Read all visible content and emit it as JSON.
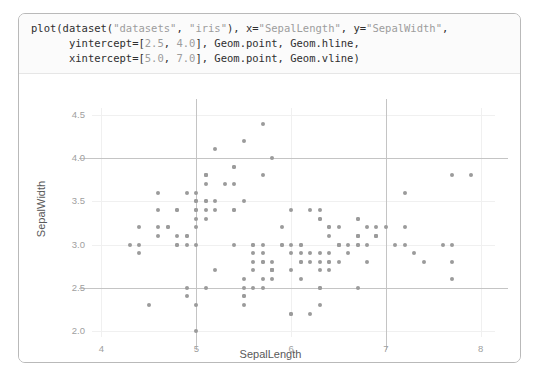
{
  "code": {
    "lines": [
      [
        {
          "t": "plot(dataset(",
          "k": "plain"
        },
        {
          "t": "\"datasets\"",
          "k": "lit"
        },
        {
          "t": ", ",
          "k": "plain"
        },
        {
          "t": "\"iris\"",
          "k": "lit"
        },
        {
          "t": "), x=",
          "k": "plain"
        },
        {
          "t": "\"SepalLength\"",
          "k": "lit"
        },
        {
          "t": ", y=",
          "k": "plain"
        },
        {
          "t": "\"SepalWidth\"",
          "k": "lit"
        },
        {
          "t": ",",
          "k": "plain"
        }
      ],
      [
        {
          "t": "      yintercept=[",
          "k": "plain"
        },
        {
          "t": "2.5",
          "k": "lit"
        },
        {
          "t": ", ",
          "k": "plain"
        },
        {
          "t": "4.0",
          "k": "lit"
        },
        {
          "t": "], Geom.point, Geom.hline,",
          "k": "plain"
        }
      ],
      [
        {
          "t": "      xintercept=[",
          "k": "plain"
        },
        {
          "t": "5.0",
          "k": "lit"
        },
        {
          "t": ", ",
          "k": "plain"
        },
        {
          "t": "7.0",
          "k": "lit"
        },
        {
          "t": "], Geom.point, Geom.vline)",
          "k": "plain"
        }
      ]
    ],
    "plain_color": "#2f2f2f",
    "literal_color": "#9d9d9d",
    "background": "#fbfbfb"
  },
  "chart_data": {
    "type": "scatter",
    "title": "",
    "xlabel": "SepalLength",
    "ylabel": "SepalWidth",
    "xlim": [
      3.9,
      8.15
    ],
    "ylim": [
      1.93,
      4.58
    ],
    "xticks": [
      4,
      5,
      6,
      7,
      8
    ],
    "yticks": [
      2.0,
      2.5,
      3.0,
      3.5,
      4.0,
      4.5
    ],
    "xtick_labels": [
      "4",
      "5",
      "6",
      "7",
      "8"
    ],
    "ytick_labels": [
      "2.0",
      "2.5",
      "3.0",
      "3.5",
      "4.0",
      "4.5"
    ],
    "grid": true,
    "legend": "none",
    "point_color": "#9b9b9b",
    "point_size": 4,
    "intercept_color": "#c4c4c4",
    "yintercept": [
      2.5,
      4.0
    ],
    "xintercept": [
      5.0,
      7.0
    ],
    "series": [
      {
        "name": "iris",
        "x": [
          5.1,
          4.9,
          4.7,
          4.6,
          5.0,
          5.4,
          4.6,
          5.0,
          4.4,
          4.9,
          5.4,
          4.8,
          4.8,
          4.3,
          5.8,
          5.7,
          5.4,
          5.1,
          5.7,
          5.1,
          5.4,
          5.1,
          4.6,
          5.1,
          4.8,
          5.0,
          5.0,
          5.2,
          5.2,
          4.7,
          4.8,
          5.4,
          5.2,
          5.5,
          4.9,
          5.0,
          5.5,
          4.9,
          4.4,
          5.1,
          5.0,
          4.5,
          4.4,
          5.0,
          5.1,
          4.8,
          5.1,
          4.6,
          5.3,
          5.0,
          7.0,
          6.4,
          6.9,
          5.5,
          6.5,
          5.7,
          6.3,
          4.9,
          6.6,
          5.2,
          5.0,
          5.9,
          6.0,
          6.1,
          5.6,
          6.7,
          5.6,
          5.8,
          6.2,
          5.6,
          5.9,
          6.1,
          6.3,
          6.1,
          6.4,
          6.6,
          6.8,
          6.7,
          6.0,
          5.7,
          5.5,
          5.5,
          5.8,
          6.0,
          5.4,
          6.0,
          6.7,
          6.3,
          5.6,
          5.5,
          5.5,
          6.1,
          5.8,
          5.0,
          5.6,
          5.7,
          5.7,
          6.2,
          5.1,
          5.7,
          6.3,
          5.8,
          7.1,
          6.3,
          6.5,
          7.6,
          4.9,
          7.3,
          6.7,
          7.2,
          6.5,
          6.4,
          6.8,
          5.7,
          5.8,
          6.4,
          6.5,
          7.7,
          7.7,
          6.0,
          6.9,
          5.6,
          7.7,
          6.3,
          6.7,
          7.2,
          6.2,
          6.1,
          6.4,
          7.2,
          7.4,
          7.9,
          6.4,
          6.3,
          6.1,
          7.7,
          6.3,
          6.4,
          6.0,
          6.9,
          6.7,
          6.9,
          5.8,
          6.8,
          6.7,
          6.7,
          6.3,
          6.5,
          6.2,
          5.9
        ],
        "y": [
          3.5,
          3.0,
          3.2,
          3.1,
          3.6,
          3.9,
          3.4,
          3.4,
          2.9,
          3.1,
          3.7,
          3.4,
          3.0,
          3.0,
          4.0,
          4.4,
          3.9,
          3.5,
          3.8,
          3.8,
          3.4,
          3.7,
          3.6,
          3.3,
          3.4,
          3.0,
          3.4,
          3.5,
          3.4,
          3.2,
          3.1,
          3.4,
          4.1,
          4.2,
          3.1,
          3.2,
          3.5,
          3.6,
          3.0,
          3.4,
          3.5,
          2.3,
          3.2,
          3.5,
          3.8,
          3.0,
          3.8,
          3.2,
          3.7,
          3.3,
          3.2,
          3.2,
          3.1,
          2.3,
          2.8,
          2.8,
          3.3,
          2.4,
          2.9,
          2.7,
          2.0,
          3.0,
          2.2,
          2.9,
          2.9,
          3.1,
          3.0,
          2.7,
          2.2,
          2.5,
          3.2,
          2.8,
          2.5,
          2.8,
          2.9,
          3.0,
          2.8,
          3.0,
          2.9,
          2.6,
          2.4,
          2.4,
          2.7,
          2.7,
          3.0,
          3.4,
          3.1,
          2.3,
          3.0,
          2.5,
          2.6,
          3.0,
          2.6,
          2.3,
          2.7,
          3.0,
          2.9,
          2.9,
          2.5,
          2.8,
          3.3,
          2.7,
          3.0,
          2.9,
          3.0,
          3.0,
          2.5,
          2.9,
          2.5,
          3.6,
          3.2,
          2.7,
          3.0,
          2.5,
          2.8,
          3.2,
          3.0,
          3.8,
          2.6,
          2.2,
          3.2,
          2.8,
          2.8,
          2.7,
          3.3,
          3.2,
          2.8,
          3.0,
          2.8,
          3.0,
          2.8,
          3.8,
          2.8,
          2.8,
          2.6,
          3.0,
          3.4,
          3.1,
          3.0,
          3.1,
          3.1,
          3.1,
          2.7,
          3.2,
          3.3,
          3.0,
          2.5,
          3.0,
          3.4,
          3.0
        ]
      }
    ]
  }
}
